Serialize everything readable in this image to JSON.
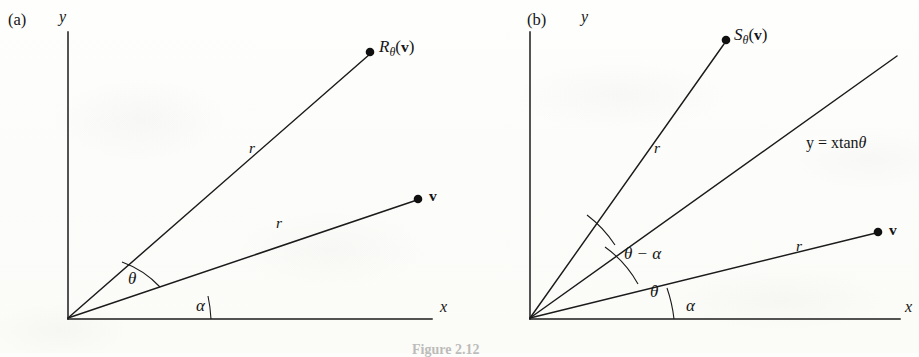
{
  "figure": {
    "caption": "Figure 2.12",
    "background_color": "#fcfcfa",
    "ink_color": "#151515"
  },
  "panels": [
    {
      "id": "a",
      "id_label": "(a)",
      "axes": {
        "x_label": "x",
        "y_label": "y"
      },
      "points": [
        {
          "name": "rotated-point",
          "label_parts": {
            "base": "R",
            "sub": "θ",
            "open": "(",
            "vec": "v",
            "close": ")"
          },
          "label_text": "Rθ(v)"
        },
        {
          "name": "original-vector",
          "label_text": "v"
        }
      ],
      "segments": [
        {
          "name": "radius-to-rotated-point",
          "label": "r"
        },
        {
          "name": "radius-to-v",
          "label": "r"
        }
      ],
      "angles": [
        {
          "name": "theta-angle",
          "label": "θ"
        },
        {
          "name": "alpha-angle",
          "label": "α"
        }
      ]
    },
    {
      "id": "b",
      "id_label": "(b)",
      "axes": {
        "x_label": "x",
        "y_label": "y"
      },
      "points": [
        {
          "name": "reflected-point",
          "label_parts": {
            "base": "S",
            "sub": "θ",
            "open": "(",
            "vec": "v",
            "close": ")"
          },
          "label_text": "Sθ(v)"
        },
        {
          "name": "original-vector",
          "label_text": "v"
        }
      ],
      "segments": [
        {
          "name": "radius-to-reflected-point",
          "label": "r"
        },
        {
          "name": "radius-to-v",
          "label": "r"
        }
      ],
      "mirror_line": {
        "name": "mirror-line",
        "label_prefix": "y = xtan",
        "label_symbol": "θ",
        "label_text": "y = xtanθ"
      },
      "angles": [
        {
          "name": "theta-minus-alpha-angle",
          "label": "θ − α"
        },
        {
          "name": "theta-angle",
          "label": "θ"
        },
        {
          "name": "alpha-angle",
          "label": "α"
        }
      ]
    }
  ]
}
